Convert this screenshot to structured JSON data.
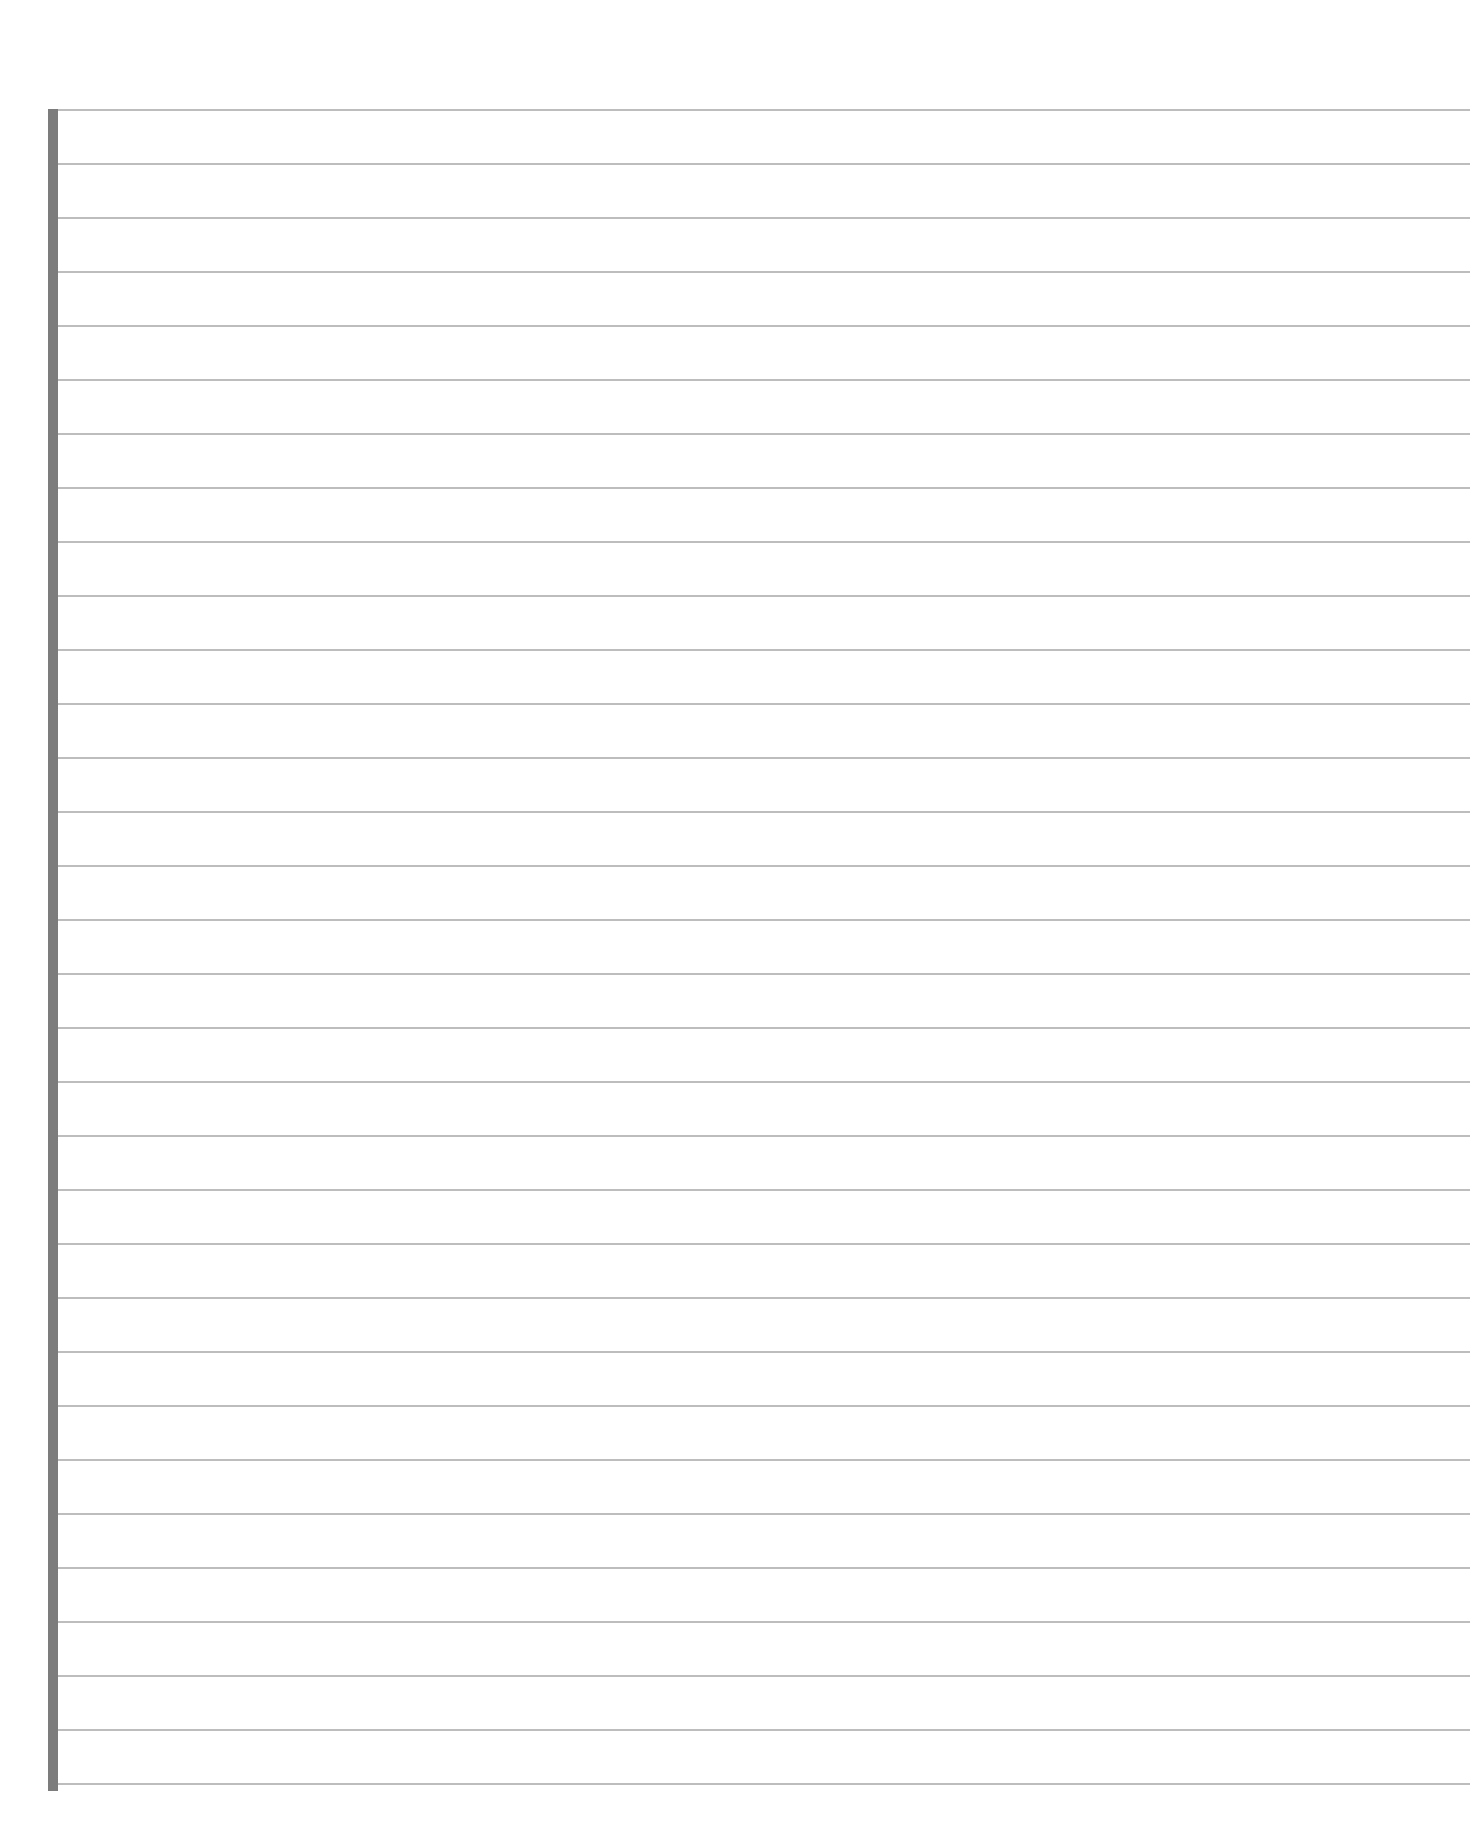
{
  "page": {
    "type": "lined-paper",
    "background_color": "#ffffff",
    "margin_bar_color": "#7c7c7c",
    "rule_color": "#bdbdbd",
    "rule_count": 32,
    "rule_spacing_px": 54,
    "first_rule_y_px": 110
  },
  "content": {
    "text": ""
  }
}
